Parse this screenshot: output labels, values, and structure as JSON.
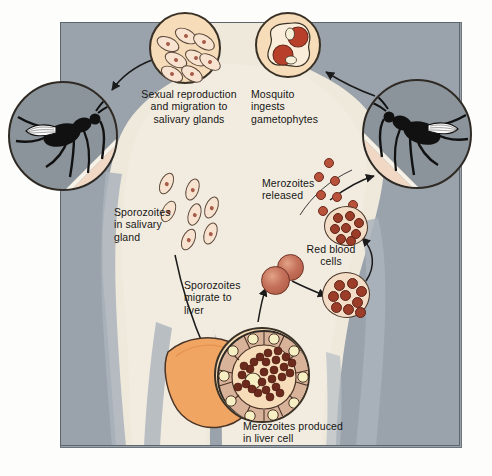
{
  "figure": {
    "domain": "Diagram",
    "background_color": "#9aa3ab",
    "human_silhouette_color": "#efe9dc",
    "accent_cell_color": "#f6dcb8",
    "parasite_color": "#9c3d2a",
    "rbc_color": "#c4705a",
    "liver_color": "#f0a563"
  },
  "labels": {
    "sexual_reproduction": "Sexual reproduction\nand migration to\nsalivary glands",
    "mosquito_ingests": "Mosquito\ningests\ngametophytes",
    "sporozoites_salivary": "Sporozoites\nin salivary\ngland",
    "merozoites_released": "Merozoites\nreleased",
    "red_blood_cells": "Red blood\ncells",
    "sporozoites_migrate": "Sporozoites\nmigrate to\nliver",
    "merozoites_liver": "Merozoites produced\nin liver cell"
  },
  "insets": {
    "oocyst_sporozoites": {
      "name": "sporozoite-cluster-inset",
      "cx": 185,
      "cy": 48,
      "r": 36,
      "sporozoite_count": 8,
      "fill": "#f6dcb8"
    },
    "gametophytes": {
      "name": "gametophyte-inset",
      "cx": 288,
      "cy": 45,
      "r": 33,
      "gametophyte_count": 2,
      "fill": "#f6dcb8"
    },
    "mosquito_left": {
      "name": "mosquito-left-inset",
      "cx": 62,
      "cy": 135,
      "r": 55,
      "fill": "#8c949b"
    },
    "mosquito_right": {
      "name": "mosquito-right-inset",
      "cx": 417,
      "cy": 133,
      "r": 55,
      "fill": "#8c949b"
    },
    "liver_cell": {
      "name": "liver-cell-inset",
      "cx": 262,
      "cy": 375,
      "r": 48,
      "ring_cell_count": 14,
      "merozoite_count": 26
    },
    "infected_rbc": {
      "name": "infected-red-blood-cell",
      "cx": 345,
      "cy": 295,
      "r": 25,
      "merozoite_count": 9
    },
    "burst_rbc": {
      "name": "bursting-red-blood-cell",
      "cx": 345,
      "cy": 227,
      "r": 22,
      "merozoite_count": 8
    }
  },
  "elements": {
    "salivary_sporozoite_trail_count": 7,
    "merozoite_stream_count": 13,
    "free_rbc_count": 2,
    "liver_name": "liver-organ"
  },
  "arrows": [
    {
      "name": "arrow-gametophyte-to-sporozoite",
      "from": "mosquito_right",
      "to": "oocyst_sporozoites"
    },
    {
      "name": "arrow-sporozoite-to-mosquito",
      "from": "oocyst_sporozoites",
      "to": "mosquito_left"
    },
    {
      "name": "arrow-sporozoites-to-liver",
      "from": "salivary_gland",
      "to": "liver"
    },
    {
      "name": "arrow-merozoites-to-rbc",
      "from": "liver_cell",
      "to": "red_blood_cells"
    },
    {
      "name": "arrow-rbc-to-infected",
      "from": "red_blood_cells",
      "to": "infected_rbc"
    },
    {
      "name": "arrow-infected-to-burst",
      "from": "infected_rbc",
      "to": "burst_rbc"
    },
    {
      "name": "arrow-merozoites-to-mosquito",
      "from": "burst_rbc",
      "to": "mosquito_right"
    }
  ]
}
